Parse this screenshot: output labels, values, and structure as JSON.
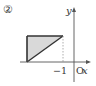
{
  "figure": {
    "number_label": "②",
    "axes": {
      "x_label": "x",
      "y_label": "y",
      "origin_label": "O",
      "tick_label": "−1"
    },
    "shape": {
      "type": "right-triangle",
      "fill": "#d9d9d9",
      "stroke": "#333333",
      "description": "Shaded region left of x = -1, above the x-axis"
    },
    "guide_line": "dashed vertical line at x = -1"
  },
  "colors": {
    "axis": "#555555",
    "shape_fill": "#d9d9d9",
    "shape_stroke": "#333333",
    "dashed": "#999999"
  }
}
